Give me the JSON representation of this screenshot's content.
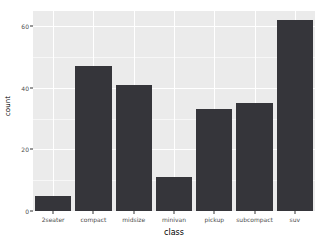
{
  "chart_data": {
    "type": "bar",
    "title": "",
    "subtitle": "",
    "xlabel": "class",
    "ylabel": "count",
    "categories": [
      "2seater",
      "compact",
      "midsize",
      "minivan",
      "pickup",
      "subcompact",
      "suv"
    ],
    "values": [
      5,
      47,
      41,
      11,
      33,
      35,
      62
    ],
    "ylim": [
      0,
      65
    ],
    "y_ticks": [
      0,
      20,
      40,
      60
    ],
    "y_tick_labels": [
      "0",
      "20",
      "40",
      "60"
    ],
    "y_minor_ticks": [
      10,
      30,
      50
    ],
    "grid": true,
    "legend": "none",
    "series": [
      {
        "name": "count",
        "values": [
          5,
          47,
          41,
          11,
          33,
          35,
          62
        ]
      }
    ],
    "colors": {
      "bar_fill": "#35353a",
      "panel_background": "#ebebeb",
      "grid_major": "#ffffff",
      "grid_minor": "#f7f7f7",
      "axis_text": "#4d4d4d",
      "axis_title": "#000000",
      "plot_background": "#ffffff"
    }
  }
}
